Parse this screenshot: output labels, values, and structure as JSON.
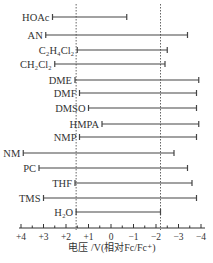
{
  "chart_data": {
    "type": "range-bar",
    "title": "",
    "xlabel": "电压 /V(相对Fc/Fc⁺)",
    "ylabel": "",
    "x_ticks": [
      "+4",
      "+3",
      "+2",
      "+1",
      "0",
      "−1",
      "−2",
      "−3",
      "−4"
    ],
    "x_tick_values": [
      4,
      3,
      2,
      1,
      0,
      -1,
      -2,
      -3,
      -4
    ],
    "xlim": [
      4,
      -4
    ],
    "reference_lines": [
      1.55,
      -2.2
    ],
    "grid": false,
    "legend": null,
    "series": [
      {
        "name": "HOAc",
        "label": "HOAc",
        "start": 2.6,
        "end": -0.7
      },
      {
        "name": "AN",
        "label": "AN",
        "start": 2.9,
        "end": -3.4
      },
      {
        "name": "C2H4Cl2",
        "label": "C₂H₄Cl₂",
        "start": 1.5,
        "end": -2.5
      },
      {
        "name": "CH2Cl2",
        "label": "CH₂Cl₂",
        "start": 2.5,
        "end": -2.4
      },
      {
        "name": "DME",
        "label": "DME",
        "start": 1.6,
        "end": -3.9
      },
      {
        "name": "DMF",
        "label": "DMF",
        "start": 1.4,
        "end": -3.8
      },
      {
        "name": "DMSO",
        "label": "DMSO",
        "start": 1.0,
        "end": -3.8
      },
      {
        "name": "HMPA",
        "label": "HMPA",
        "start": 0.4,
        "end": -3.9
      },
      {
        "name": "NMP",
        "label": "NMP",
        "start": 1.4,
        "end": -3.8
      },
      {
        "name": "NM",
        "label": "NM",
        "start": 3.9,
        "end": -2.8
      },
      {
        "name": "PC",
        "label": "PC",
        "start": 3.2,
        "end": -3.4
      },
      {
        "name": "THF",
        "label": "THF",
        "start": 1.6,
        "end": -3.6
      },
      {
        "name": "TMS",
        "label": "TMS",
        "start": 3.0,
        "end": -3.8
      },
      {
        "name": "H2O",
        "label": "H₂O",
        "start": 1.55,
        "end": -2.2
      }
    ]
  },
  "colors": {
    "bar": "#444444",
    "axis": "#333333",
    "reference_line": "#555555",
    "background": "#ffffff"
  }
}
